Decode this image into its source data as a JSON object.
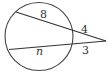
{
  "diagram": {
    "type": "circle-two-secants",
    "circle": {
      "cx": 39,
      "cy": 36.5,
      "r": 34
    },
    "external_point": {
      "x": 106,
      "y": 41
    },
    "secant_top": {
      "start": {
        "x": 16,
        "y": 12
      },
      "inner_label": "8",
      "outer_label": "4"
    },
    "secant_bottom": {
      "start": {
        "x": 9,
        "y": 49.5
      },
      "inner_label": "n",
      "outer_label": "3"
    },
    "stroke_color": "#333333"
  }
}
